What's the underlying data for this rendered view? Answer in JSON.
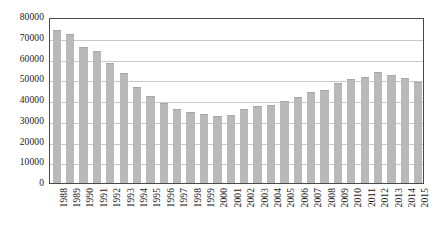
{
  "chart_data": {
    "type": "bar",
    "title": "",
    "subtitle": "",
    "xlabel": "",
    "ylabel": "",
    "categories": [
      "1988",
      "1989",
      "1990",
      "1991",
      "1992",
      "1993",
      "1994",
      "1995",
      "1996",
      "1997",
      "1998",
      "1999",
      "2000",
      "2001",
      "2002",
      "2003",
      "2004",
      "2005",
      "2006",
      "2007",
      "2008",
      "2009",
      "2010",
      "2011",
      "2012",
      "2013",
      "2014",
      "2015"
    ],
    "values": [
      73800,
      71900,
      65700,
      63700,
      58000,
      52800,
      46100,
      42100,
      38700,
      35500,
      34000,
      33100,
      32300,
      33000,
      35600,
      36900,
      37400,
      39300,
      41600,
      44000,
      44700,
      48200,
      50200,
      51200,
      53400,
      52200,
      50400,
      48600
    ],
    "series": [
      {
        "name": "Series 1",
        "values": [
          73800,
          71900,
          65700,
          63700,
          58000,
          52800,
          46100,
          42100,
          38700,
          35500,
          34000,
          33100,
          32300,
          33000,
          35600,
          36900,
          37400,
          39300,
          41600,
          44000,
          44700,
          48200,
          50200,
          51200,
          53400,
          52200,
          50400,
          48600
        ]
      }
    ],
    "ylim": [
      0,
      80000
    ],
    "yticks": [
      0,
      10000,
      20000,
      30000,
      40000,
      50000,
      60000,
      70000,
      80000
    ],
    "ytick_labels": [
      "0",
      "10000",
      "20000",
      "30000",
      "40000",
      "50000",
      "60000",
      "70000",
      "80000"
    ],
    "grid": true,
    "grid_axis": "y",
    "legend": false,
    "legend_position": "none",
    "annotations": [],
    "colors": {
      "bar_fill": "#b9b9b9",
      "bar_edge": "#a8a8a8",
      "gridline": "#c9c9c9",
      "axis_frame": "#4a4a4a",
      "text": "#1a1a1a",
      "background": "#ffffff"
    },
    "xtick_rotation": -90
  }
}
